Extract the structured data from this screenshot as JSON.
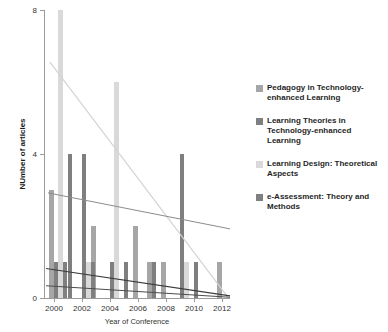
{
  "chart_data": {
    "type": "bar",
    "title": "",
    "xlabel": "Year of Conference",
    "ylabel": "NUmber of articles",
    "categories": [
      "2000",
      "2001",
      "2002",
      "2003",
      "2004",
      "2005",
      "2006",
      "2007",
      "2008",
      "2009",
      "2010",
      "2011",
      "2012"
    ],
    "xticks": [
      "2000",
      "2002",
      "2004",
      "2006",
      "2008",
      "2010",
      "2012"
    ],
    "yticks": [
      "0",
      "4",
      "8"
    ],
    "ylim": [
      0,
      8
    ],
    "grid": false,
    "legend_position": "right",
    "series": [
      {
        "name": "Pedagogy in Technology-enhanced Learning",
        "color": "#a6a6a6",
        "values": [
          3,
          0,
          0,
          2,
          0,
          0,
          2,
          1,
          1,
          0,
          0,
          0,
          1
        ]
      },
      {
        "name": "Learning Theories in Technology-enhanced Learning",
        "color": "#7f7f7f",
        "values": [
          1,
          4,
          4,
          0,
          1,
          1,
          0,
          1,
          0,
          4,
          1,
          0,
          0
        ]
      },
      {
        "name": "Learning Design: Theoretical Aspects",
        "color": "#d9d9d9",
        "values": [
          8,
          0,
          1,
          0,
          6,
          0,
          0,
          0,
          0,
          1,
          0,
          0,
          0
        ]
      },
      {
        "name": "e-Assessment: Theory and Methods",
        "color": "#808080",
        "values": [
          1,
          0,
          1,
          0,
          0,
          0,
          0,
          0,
          0,
          0,
          0,
          0,
          0
        ]
      }
    ],
    "trendlines": [
      {
        "name": "Learning Design trend",
        "color": "#d4d4d4",
        "width": 1.2,
        "x0": 6,
        "y0": 6.55,
        "x1": 184,
        "y1": 0.02
      },
      {
        "name": "Pedagogy trend",
        "color": "#8c8c8c",
        "width": 1.0,
        "x0": 4,
        "y0": 2.92,
        "x1": 186,
        "y1": 1.92
      },
      {
        "name": "Learning Theories trend",
        "color": "#3b3b3b",
        "width": 1.1,
        "x0": 2,
        "y0": 0.82,
        "x1": 186,
        "y1": 0.06
      },
      {
        "name": "e-Assessment trend",
        "color": "#4d4d4d",
        "width": 1.0,
        "x0": 2,
        "y0": 0.34,
        "x1": 186,
        "y1": 0.02
      }
    ]
  },
  "legend": {
    "items": [
      {
        "label": "Pedagogy in Technology-enhanced Learning",
        "color": "#a6a6a6"
      },
      {
        "label": "Learning Theories in Technology-enhanced Learning",
        "color": "#7f7f7f"
      },
      {
        "label": "Learning Design: Theoretical Aspects",
        "color": "#d9d9d9"
      },
      {
        "label": "e-Assessment: Theory and Methods",
        "color": "#808080"
      }
    ]
  }
}
